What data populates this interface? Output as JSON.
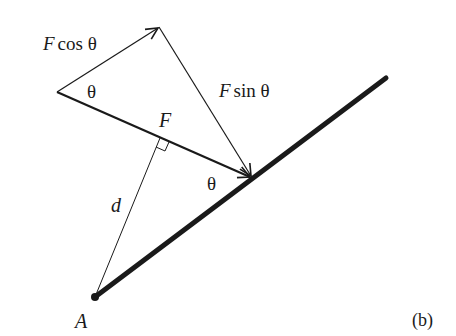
{
  "figure": {
    "panel_label": "(b)",
    "labels": {
      "f_cos_theta": {
        "F": "F",
        "rest": "cos θ"
      },
      "f_sin_theta": {
        "F": "F",
        "rest": "sin θ"
      },
      "theta_left": "θ",
      "theta_right": "θ",
      "force": "F",
      "distance": "d",
      "pivot": "A"
    },
    "colors": {
      "ink": "#1a1a1a",
      "background": "#ffffff"
    }
  }
}
